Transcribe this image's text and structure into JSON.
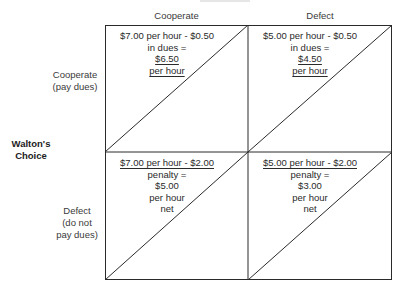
{
  "header": {
    "top_cut_label": "Union's Choice (partially cropped)"
  },
  "columns": [
    {
      "label": "Cooperate"
    },
    {
      "label": "Defect"
    }
  ],
  "rows": [
    {
      "label_line1": "Cooperate",
      "label_line2": "(pay dues)",
      "label_line3": ""
    },
    {
      "label_line1": "Defect",
      "label_line2": "(do not",
      "label_line3": "pay dues)"
    }
  ],
  "row_axis_title": {
    "line1": "Walton's",
    "line2": "Choice"
  },
  "cells": {
    "cc": {
      "l1": "$7.00 per hour - $0.50",
      "l2": "in dues =",
      "l3": "$6.50",
      "l4": "per hour",
      "l5": ""
    },
    "cd": {
      "l1": "$5.00 per hour - $0.50",
      "l2": "in dues =",
      "l3": "$4.50",
      "l4": "per hour",
      "l5": ""
    },
    "dc": {
      "l1": "$7.00 per hour - $2.00",
      "l2": "penalty =",
      "l3": "$5.00",
      "l4": "per hour",
      "l5": "net"
    },
    "dd": {
      "l1": "$5.00 per hour - $2.00",
      "l2": "penalty =",
      "l3": "$3.00",
      "l4": "per hour",
      "l5": "net"
    }
  },
  "colors": {
    "line": "#2a2a2a",
    "text": "#2a2a2a",
    "background": "#ffffff"
  }
}
